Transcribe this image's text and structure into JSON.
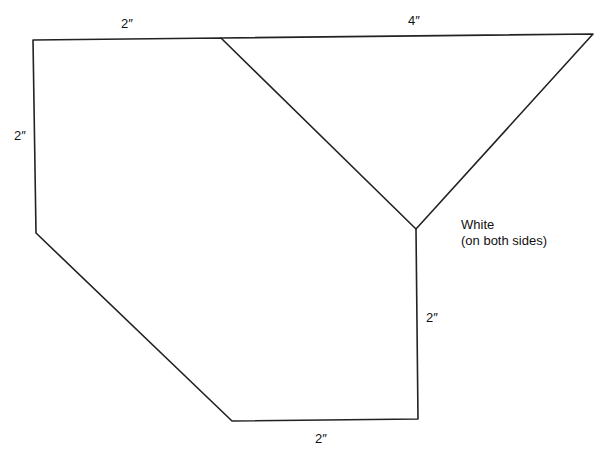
{
  "diagram": {
    "type": "pattern-template",
    "shapes": [
      {
        "name": "hexagon-panel",
        "points": [
          [
            33,
            40
          ],
          [
            221,
            38
          ],
          [
            416,
            229
          ],
          [
            418,
            419
          ],
          [
            232,
            421
          ],
          [
            36,
            233
          ]
        ]
      },
      {
        "name": "triangle-panel",
        "points": [
          [
            221,
            38
          ],
          [
            593,
            34
          ],
          [
            416,
            229
          ]
        ]
      }
    ],
    "labels": {
      "top_left_edge": "2″",
      "top_right_edge": "4″",
      "left_edge": "2″",
      "right_edge": "2″",
      "bottom_edge": "2″",
      "note_line1": "White",
      "note_line2": "(on both sides)"
    },
    "colors": {
      "line": "#222222",
      "text": "#111111",
      "background": "#ffffff"
    }
  }
}
